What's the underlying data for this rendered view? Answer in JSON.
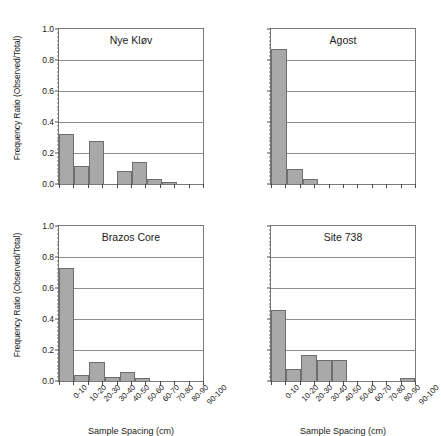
{
  "figure": {
    "axis": {
      "ylabel": "Frequency Ratio (Observed/Total)",
      "xlabel": "Sample Spacing (cm)",
      "yticks": [
        "0.0",
        "0.2",
        "0.4",
        "0.6",
        "0.8",
        "1.0"
      ],
      "ylim": [
        0,
        1
      ],
      "xticklabels": [
        "0-10",
        "10-20",
        "20-30",
        "30-40",
        "40-50",
        "50-60",
        "60-70",
        "70-80",
        "80-90",
        "90-100"
      ]
    },
    "colors": {
      "bar_fill": "#a9a9a9",
      "bar_edge": "#6e6e6e",
      "grid": "#8e8e8e",
      "axis": "#4a4a4a",
      "text": "#1a1a1a",
      "background": "#ffffff"
    }
  },
  "chart_data": [
    {
      "type": "bar",
      "title": "Nye Kløv",
      "xlabel": "Sample Spacing (cm)",
      "ylabel": "Frequency Ratio (Observed/Total)",
      "categories": [
        "0-10",
        "10-20",
        "20-30",
        "30-40",
        "40-50",
        "50-60",
        "60-70",
        "70-80",
        "80-90",
        "90-100"
      ],
      "values": [
        0.32,
        0.115,
        0.28,
        0.0,
        0.085,
        0.145,
        0.03,
        0.015,
        0.0,
        0.0
      ],
      "ylim": [
        0,
        1
      ],
      "grid": true
    },
    {
      "type": "bar",
      "title": "Agost",
      "xlabel": "Sample Spacing (cm)",
      "ylabel": "Frequency Ratio (Observed/Total)",
      "categories": [
        "0-10",
        "10-20",
        "20-30",
        "30-40",
        "40-50",
        "50-60",
        "60-70",
        "70-80",
        "80-90",
        "90-100"
      ],
      "values": [
        0.87,
        0.095,
        0.03,
        0.0,
        0.0,
        0.0,
        0.0,
        0.0,
        0.0,
        0.0
      ],
      "ylim": [
        0,
        1
      ],
      "grid": true
    },
    {
      "type": "bar",
      "title": "Brazos Core",
      "xlabel": "Sample Spacing (cm)",
      "ylabel": "Frequency Ratio (Observed/Total)",
      "categories": [
        "0-10",
        "10-20",
        "20-30",
        "30-40",
        "40-50",
        "50-60",
        "60-70",
        "70-80",
        "80-90",
        "90-100"
      ],
      "values": [
        0.73,
        0.04,
        0.125,
        0.025,
        0.055,
        0.018,
        0.0,
        0.0,
        0.0,
        0.0
      ],
      "ylim": [
        0,
        1
      ],
      "grid": true
    },
    {
      "type": "bar",
      "title": "Site 738",
      "xlabel": "Sample Spacing (cm)",
      "ylabel": "Frequency Ratio (Observed/Total)",
      "categories": [
        "0-10",
        "10-20",
        "20-30",
        "30-40",
        "40-50",
        "50-60",
        "60-70",
        "70-80",
        "80-90",
        "90-100"
      ],
      "values": [
        0.46,
        0.08,
        0.17,
        0.135,
        0.135,
        0.0,
        0.0,
        0.0,
        0.0,
        0.02
      ],
      "ylim": [
        0,
        1
      ],
      "grid": true
    }
  ]
}
